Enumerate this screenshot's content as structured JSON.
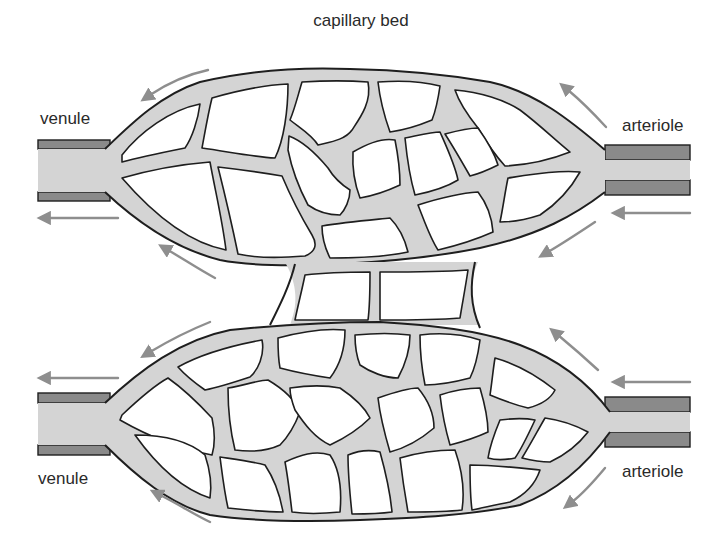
{
  "diagram": {
    "title": "capillary bed",
    "labels": {
      "top_left": "venule",
      "top_right": "arteriole",
      "bottom_left": "venule",
      "bottom_right": "arteriole"
    },
    "components": [
      {
        "name": "upper capillary network",
        "type": "capillary-bed"
      },
      {
        "name": "lower capillary network",
        "type": "capillary-bed"
      },
      {
        "name": "connecting capillaries",
        "type": "capillary-bridge"
      },
      {
        "name": "upper venule",
        "type": "vessel",
        "side": "left"
      },
      {
        "name": "upper arteriole",
        "type": "vessel",
        "side": "right"
      },
      {
        "name": "lower venule",
        "type": "vessel",
        "side": "left"
      },
      {
        "name": "lower arteriole",
        "type": "vessel",
        "side": "right"
      }
    ],
    "flow_direction": "right-to-left (arteriole to venule)",
    "colors": {
      "vessel_fill": "#d4d4d4",
      "vessel_wall": "#8a8a8a",
      "outline": "#1e1e1e",
      "arrow": "#8e8e8e",
      "background": "#ffffff",
      "text": "#2a2a2a"
    }
  }
}
